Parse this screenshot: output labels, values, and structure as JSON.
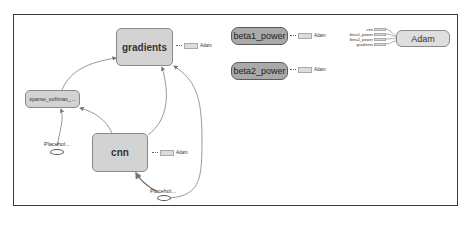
{
  "graph": {
    "nodes": {
      "gradients": {
        "label": "gradients",
        "aux_label": "Adam"
      },
      "cnn": {
        "label": "cnn",
        "aux_label": "Adam"
      },
      "sparse_softmax": {
        "label": "sparse_softmax_..."
      },
      "placeholder_left": {
        "label": "Placehol..."
      },
      "placeholder_bottom": {
        "label": "Placehol..."
      },
      "beta1_power": {
        "label": "beta1_power",
        "aux_label": "Adam"
      },
      "beta2_power": {
        "label": "beta2_power",
        "aux_label": "Adam"
      },
      "adam": {
        "label": "Adam",
        "inputs": [
          "cnn",
          "beta1_power",
          "beta2_power",
          "gradients"
        ]
      }
    },
    "edges": [
      {
        "from": "sparse_softmax",
        "to": "gradients"
      },
      {
        "from": "placeholder_left",
        "to": "sparse_softmax"
      },
      {
        "from": "cnn",
        "to": "sparse_softmax"
      },
      {
        "from": "cnn",
        "to": "gradients"
      },
      {
        "from": "placeholder_bottom",
        "to": "cnn"
      },
      {
        "from": "placeholder_bottom",
        "to": "gradients"
      }
    ],
    "colors": {
      "frame_border": "#3a3a3a",
      "op_node_fill": "#d3d3d3",
      "variable_node_fill": "#a9a9a9",
      "edge": "#8c8c8c"
    }
  }
}
